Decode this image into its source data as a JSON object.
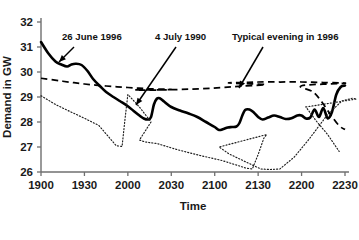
{
  "chart_data": {
    "type": "line",
    "title": "",
    "xlabel": "Time",
    "ylabel": "Demand in GW",
    "xlim": [
      1900,
      2230
    ],
    "ylim": [
      26,
      32
    ],
    "grid": false,
    "legend_position": "inline-annotations",
    "x_tick_labels": [
      "1900",
      "1930",
      "2000",
      "2030",
      "2100",
      "2130",
      "2200",
      "2230"
    ],
    "x_tick_values": [
      1900,
      1930,
      2000,
      2030,
      2100,
      2130,
      2200,
      2230
    ],
    "y_tick_labels": [
      "26",
      "27",
      "28",
      "29",
      "30",
      "31",
      "32"
    ],
    "y_tick_values": [
      26,
      27,
      28,
      29,
      30,
      31,
      32
    ],
    "series": [
      {
        "name": "26 June 1996",
        "style": "solid",
        "x": [
          1900,
          1905,
          1910,
          1914,
          1918,
          1921,
          1924,
          1928,
          1932,
          1936,
          1941,
          1945,
          1950,
          1955,
          2000,
          2004,
          2008,
          2011,
          2014,
          2016,
          2018,
          2020,
          2022,
          2025,
          2030,
          2036,
          2042,
          2048,
          2054,
          2100,
          2103,
          2106,
          2109,
          2112,
          2115,
          2117,
          2119,
          2121,
          2124,
          2127,
          2130,
          2133,
          2137,
          2141,
          2145,
          2149,
          2153,
          2157,
          2200,
          2203,
          2206,
          2209,
          2212,
          2215,
          2218,
          2221,
          2224,
          2227,
          2230
        ],
        "values": [
          31.2,
          30.75,
          30.42,
          30.3,
          30.22,
          30.3,
          30.33,
          30.28,
          30.05,
          29.72,
          29.42,
          29.2,
          29.0,
          28.82,
          28.63,
          28.44,
          28.26,
          28.14,
          28.1,
          28.2,
          28.7,
          28.93,
          28.95,
          28.82,
          28.6,
          28.46,
          28.34,
          28.2,
          28.0,
          27.8,
          27.68,
          27.72,
          27.78,
          27.8,
          27.82,
          27.95,
          28.25,
          28.48,
          28.5,
          28.38,
          28.2,
          28.1,
          28.18,
          28.26,
          28.2,
          28.12,
          28.15,
          28.26,
          28.26,
          28.14,
          28.18,
          28.5,
          28.2,
          28.56,
          28.15,
          28.4,
          29.1,
          29.4,
          29.46
        ]
      },
      {
        "name": "4 July 1990",
        "style": "dotted",
        "x": [
          1900,
          1910,
          1920,
          1930,
          1940,
          1952,
          1956,
          1958,
          1960,
          1968,
          1976,
          2008,
          2012,
          2020,
          2035,
          2050,
          2065,
          2082,
          2086,
          2090,
          2094,
          2096,
          2103,
          2110,
          2118,
          2126,
          2132,
          2138,
          2145,
          2155,
          2165,
          2178,
          2188,
          2195,
          2198,
          2203,
          2210,
          2218,
          2226
        ],
        "values": [
          29.05,
          28.7,
          28.42,
          28.15,
          27.86,
          27.05,
          27.02,
          28.1,
          29.1,
          28.6,
          28.0,
          27.28,
          27.2,
          27.14,
          26.88,
          26.66,
          26.46,
          26.15,
          26.12,
          26.7,
          27.36,
          27.5,
          27.0,
          26.72,
          26.5,
          26.28,
          26.12,
          26.1,
          26.12,
          26.6,
          27.3,
          28.3,
          28.85,
          28.95,
          28.92,
          28.6,
          28.05,
          27.5,
          26.82
        ]
      },
      {
        "name": "Typical evening in 1996",
        "style": "dashed",
        "x": [
          1900,
          1915,
          1930,
          1945,
          1960,
          1975,
          1990,
          2005,
          2020,
          2035,
          2050,
          2065,
          2080,
          2095,
          2110,
          2120,
          2130,
          2145,
          2160,
          2175,
          2190,
          2200,
          2208,
          2214,
          2220,
          2226,
          2230
        ],
        "values": [
          29.75,
          29.63,
          29.52,
          29.44,
          29.38,
          29.33,
          29.3,
          29.28,
          29.28,
          29.3,
          29.33,
          29.38,
          29.44,
          29.5,
          29.56,
          29.58,
          29.6,
          29.6,
          29.6,
          29.58,
          29.55,
          29.45,
          29.2,
          28.8,
          28.3,
          27.85,
          27.7
        ]
      }
    ],
    "annotations": [
      {
        "id": "annot-26-june-1996",
        "text": "26 June 1996",
        "label_x": 62,
        "label_y": 40,
        "arrow_from_x": 74,
        "arrow_from_y": 47,
        "arrow_to_x": 59,
        "arrow_to_y": 62
      },
      {
        "id": "annot-4-july-1990",
        "text": "4 July 1990",
        "label_x": 155,
        "label_y": 40,
        "arrow_from_x": 176,
        "arrow_from_y": 47,
        "arrow_to_x": 136,
        "arrow_to_y": 105
      },
      {
        "id": "annot-typical-evening-1996",
        "text": "Typical evening in 1996",
        "label_x": 232,
        "label_y": 40,
        "arrow_from_x": 263,
        "arrow_from_y": 47,
        "arrow_to_x": 239,
        "arrow_to_y": 88
      }
    ]
  }
}
